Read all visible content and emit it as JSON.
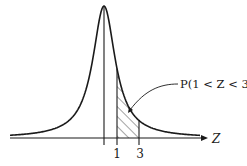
{
  "diagram": {
    "type": "normal-distribution-shaded-area",
    "axis_label": "Z",
    "tick_labels": [
      "1",
      "3"
    ],
    "annotation": "P(1 < Z < 3)",
    "shaded_region": {
      "from": 1,
      "to": 3,
      "pattern": "diagonal-hatch"
    },
    "colors": {
      "stroke": "#1a1a1a",
      "background": "#ffffff"
    }
  }
}
